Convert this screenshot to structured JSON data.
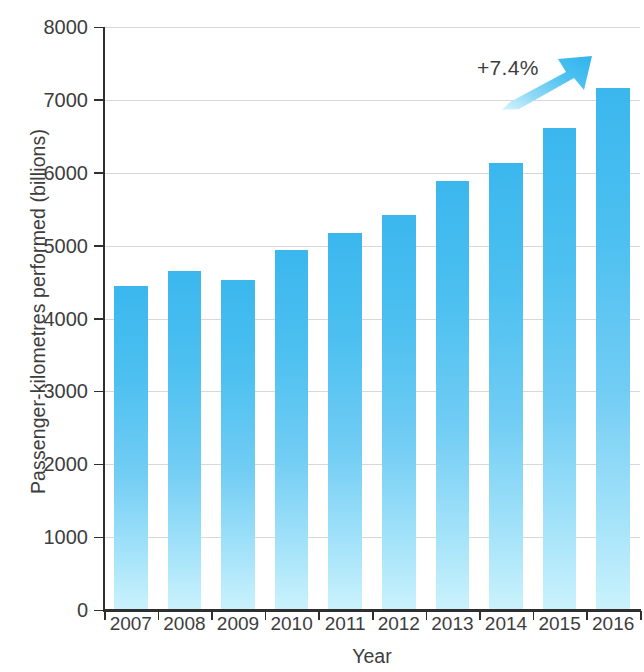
{
  "chart_data": {
    "type": "bar",
    "title": "",
    "xlabel": "Year",
    "ylabel": "Passenger-kilometres performed (billions)",
    "categories": [
      "2007",
      "2008",
      "2009",
      "2010",
      "2011",
      "2012",
      "2013",
      "2014",
      "2015",
      "2016"
    ],
    "values": [
      4450,
      4650,
      4530,
      4940,
      5170,
      5420,
      5890,
      6140,
      6610,
      7170
    ],
    "ylim": [
      0,
      8000
    ],
    "yticks": [
      0,
      1000,
      2000,
      3000,
      4000,
      5000,
      6000,
      7000,
      8000
    ],
    "ytick_labels": [
      "0",
      "1000",
      "2000",
      "3000",
      "4000",
      "5000",
      "6000",
      "7000",
      "8000"
    ],
    "grid": true,
    "legend": null,
    "series": [
      {
        "name": "Passenger-kilometres performed",
        "values": [
          4450,
          4650,
          4530,
          4940,
          5170,
          5420,
          5890,
          6140,
          6610,
          7170
        ]
      }
    ],
    "annotations": [
      {
        "text": "+7.4%",
        "icon": "up-right-arrow-icon",
        "x": "2015",
        "y": 7600
      }
    ],
    "colors": {
      "bar_top": "#3bb7ee",
      "bar_bottom": "#cbf2fc",
      "arrow": "#45c0f0",
      "axis": "#2f2f2f",
      "gridline": "#c9c9c9",
      "text": "#3d3d3d"
    }
  }
}
